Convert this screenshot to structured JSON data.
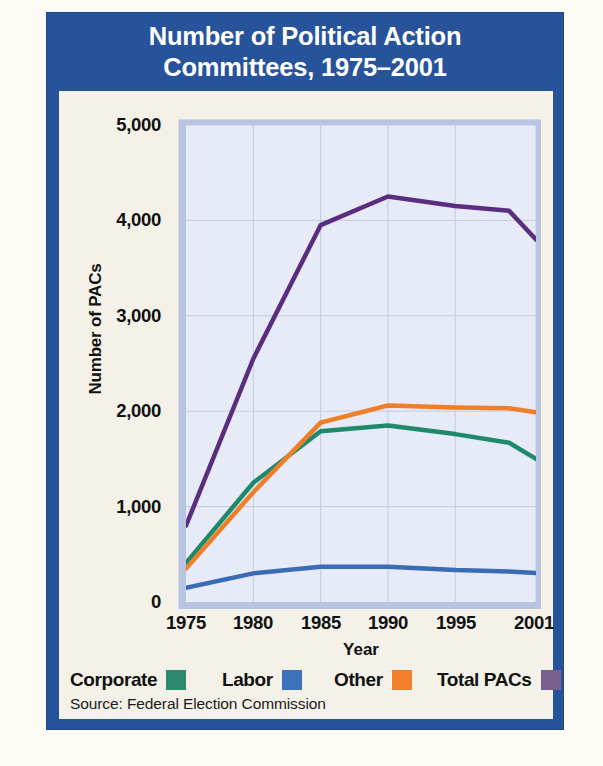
{
  "title": {
    "line1": "Number of Political Action",
    "line2": "Committees, 1975–2001"
  },
  "source": "Source: Federal Election Commission",
  "colors": {
    "frame_blue": "#27539b",
    "panel_cream": "#f4f1e8",
    "plot_fill": "#e7ebf7",
    "plot_bevel": "#b9c4e0",
    "gridline": "#c3cbe0",
    "corporate": "#1f8a6b",
    "labor": "#3a6bb5",
    "other": "#ef7e29",
    "total_pacs": "#5b2d7e",
    "legend_corporate": "#2d8a6e",
    "legend_labor": "#3f72bd",
    "legend_other": "#f2802c",
    "legend_total": "#7a5f8e"
  },
  "chart_data": {
    "type": "line",
    "title": "Number of Political Action Committees, 1975–2001",
    "xlabel": "Year",
    "ylabel": "Number of PACs",
    "xlim": [
      1975,
      2001
    ],
    "ylim": [
      0,
      5000
    ],
    "xticks": [
      1975,
      1980,
      1985,
      1990,
      1995,
      2001
    ],
    "xtick_labels": [
      "1975",
      "1980",
      "1985",
      "1990",
      "1995",
      "2001"
    ],
    "yticks": [
      0,
      1000,
      2000,
      3000,
      4000,
      5000
    ],
    "ytick_labels": [
      "0",
      "1,000",
      "2,000",
      "3,000",
      "4,000",
      "5,000"
    ],
    "grid": true,
    "legend_position": "below",
    "x": [
      1975,
      1980,
      1985,
      1990,
      1995,
      1999,
      2001
    ],
    "series": [
      {
        "name": "Corporate",
        "color": "#1f8a6b",
        "values": [
          410,
          1250,
          1790,
          1850,
          1760,
          1670,
          1500
        ]
      },
      {
        "name": "Labor",
        "color": "#3a6bb5",
        "values": [
          150,
          300,
          370,
          370,
          335,
          320,
          305
        ]
      },
      {
        "name": "Other",
        "color": "#ef7e29",
        "values": [
          350,
          1150,
          1880,
          2060,
          2040,
          2030,
          1990
        ]
      },
      {
        "name": "Total PACs",
        "color": "#5b2d7e",
        "values": [
          800,
          2550,
          3950,
          4250,
          4150,
          4100,
          3800
        ]
      }
    ]
  },
  "axis": {
    "ylabel": "Number of PACs",
    "xlabel": "Year"
  },
  "legend": [
    {
      "label": "Corporate",
      "color": "#2d8a6e",
      "swatch": "legend-swatch-corporate"
    },
    {
      "label": "Labor",
      "color": "#3f72bd",
      "swatch": "legend-swatch-labor"
    },
    {
      "label": "Other",
      "color": "#f2802c",
      "swatch": "legend-swatch-other"
    },
    {
      "label": "Total PACs",
      "color": "#7a5f8e",
      "swatch": "legend-swatch-total-pacs"
    }
  ]
}
